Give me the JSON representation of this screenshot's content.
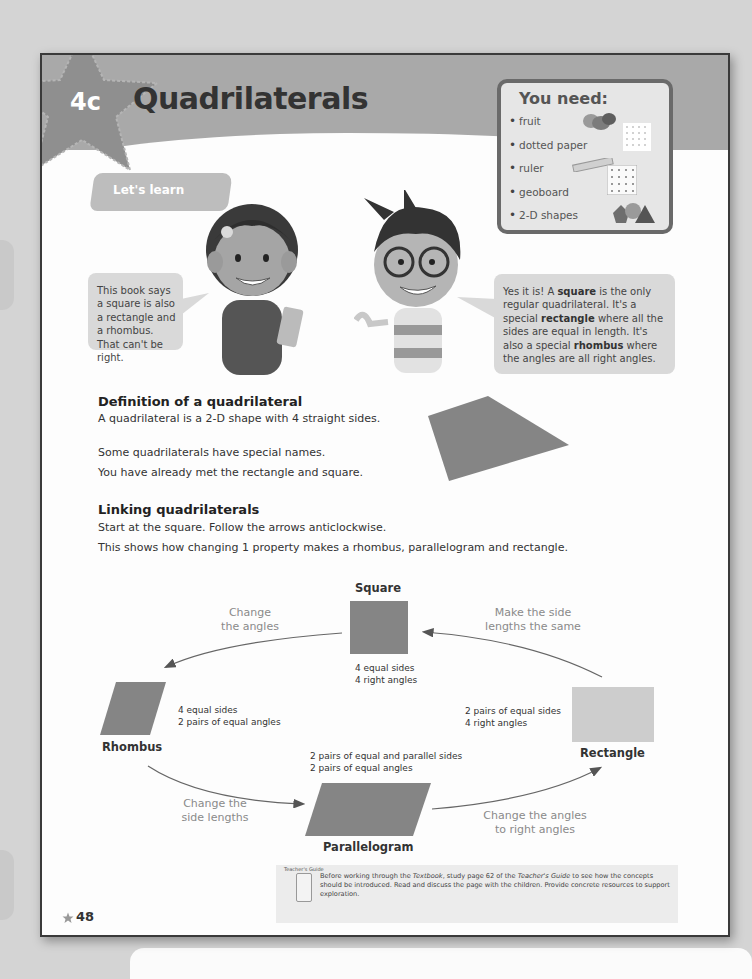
{
  "header": {
    "chapter": "4c",
    "title": "Quadrilaterals"
  },
  "you_need": {
    "heading": "You need:",
    "items": [
      {
        "label": "fruit",
        "icon": "fruit-icon"
      },
      {
        "label": "dotted paper",
        "icon": "dotted-paper-icon"
      },
      {
        "label": "ruler",
        "icon": "ruler-icon"
      },
      {
        "label": "geoboard",
        "icon": "geoboard-icon"
      },
      {
        "label": "2-D shapes",
        "icon": "shapes-icon"
      }
    ]
  },
  "lets_learn": "Let's learn",
  "speech": {
    "left": "This book says a square is also a rectangle and a rhombus. That can't be right.",
    "right_parts": [
      "Yes it is! A ",
      "square",
      " is the only regular quadrilateral. It's a special ",
      "rectangle",
      " where all the sides are equal in length. It's also a special ",
      "rhombus",
      " where the angles are all right angles."
    ]
  },
  "definition": {
    "heading": "Definition of a quadrilateral",
    "line1": "A quadrilateral is a 2-D shape with 4 straight sides.",
    "line2": "Some quadrilaterals have special names.",
    "line3": "You have already met the rectangle and square."
  },
  "linking": {
    "heading": "Linking quadrilaterals",
    "line1": "Start at the square. Follow the arrows anticlockwise.",
    "line2": "This shows how changing 1 property makes a rhombus, parallelogram and rectangle."
  },
  "diagram": {
    "square": {
      "name": "Square",
      "props": [
        "4 equal sides",
        "4 right angles"
      ]
    },
    "rhombus": {
      "name": "Rhombus",
      "props": [
        "4 equal sides",
        "2 pairs of equal angles"
      ]
    },
    "parallelogram": {
      "name": "Parallelogram",
      "props": [
        "2 pairs of equal and parallel sides",
        "2 pairs of equal angles"
      ]
    },
    "rectangle": {
      "name": "Rectangle",
      "props": [
        "2 pairs of equal sides",
        "4 right angles"
      ]
    },
    "arrows": {
      "square_to_rhombus": [
        "Change",
        "the angles"
      ],
      "rhombus_to_parallelogram": [
        "Change the",
        "side lengths"
      ],
      "parallelogram_to_rectangle": [
        "Change the angles",
        "to right angles"
      ],
      "rectangle_to_square": [
        "Make the side",
        "lengths the same"
      ]
    }
  },
  "footer": {
    "page_number": "48",
    "teachers_guide_label": "Teacher's Guide",
    "teachers_guide_parts": [
      "Before working through the ",
      "Textbook",
      ", study page 62 of the ",
      "Teacher's Guide",
      " to see how the concepts should be introduced. Read and discuss the page with the children. Provide concrete resources to support exploration."
    ]
  },
  "colors": {
    "header_band": "#a9a9a9",
    "star": "#8f8f8f",
    "shape_dark": "#858585",
    "shape_light": "#cdcdcd",
    "bubble": "#d9d9d9"
  }
}
